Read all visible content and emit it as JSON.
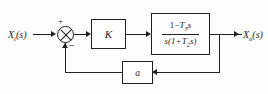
{
  "diagram": {
    "type": "control-block-diagram",
    "background_color": "#fdfdfd",
    "line_color": "#231f20"
  },
  "signals": {
    "input_label": "X",
    "input_subscript": "i",
    "input_arg": "(s)",
    "output_label": "X",
    "output_subscript": "o",
    "output_arg": "(s)"
  },
  "summing_junction": {
    "name": "comparator",
    "glyph": "circle-with-cross",
    "input_sign": "+",
    "feedback_sign": "−"
  },
  "blocks": {
    "gain": {
      "label": "K"
    },
    "plant": {
      "numerator_prefix": "1−",
      "numerator_T": "T",
      "numerator_subscript": "3",
      "numerator_suffix": "s",
      "denominator_prefix": "s(1+",
      "denominator_T": "T",
      "denominator_subscript": "2",
      "denominator_suffix": "s)"
    },
    "feedback": {
      "label": "a"
    }
  }
}
